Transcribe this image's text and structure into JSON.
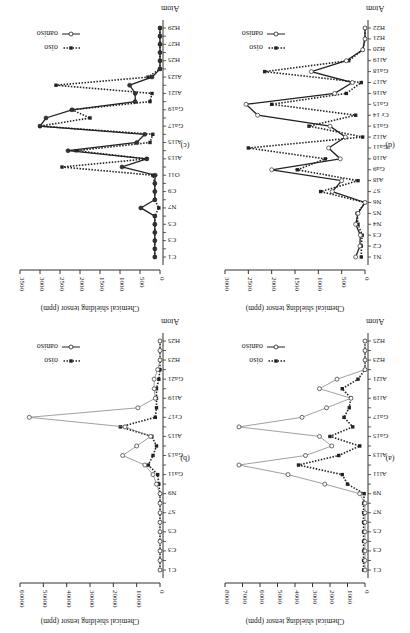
{
  "figure": {
    "orientation_note": "Figure displayed rotated 180 degrees",
    "panels": [
      "(a)",
      "(b)",
      "(c)",
      "(d)"
    ]
  },
  "chart_data": [
    {
      "id": "a",
      "type": "line",
      "panel_label": "(a)",
      "title": "",
      "xlabel": "Atom",
      "ylabel": "Chemical shielding tensor (ppm)",
      "ylim": [
        0,
        8000
      ],
      "yticks": [
        0,
        1000,
        2000,
        3000,
        4000,
        5000,
        6000,
        7000,
        8000
      ],
      "xtick_labels": [
        "C1",
        "C3",
        "C5",
        "N7",
        "N9",
        "Al11",
        "Al13",
        "Ga15",
        "Ga17",
        "Al19",
        "Al21",
        "H23",
        "H25"
      ],
      "x": [
        1,
        2,
        3,
        4,
        5,
        6,
        7,
        8,
        9,
        10,
        11,
        12,
        13,
        14,
        15,
        16,
        17,
        18,
        19,
        20,
        21,
        22,
        23,
        24,
        25
      ],
      "legend": [
        "σiso",
        "σaniso"
      ],
      "legend_position": "upper right",
      "grid": false,
      "series": [
        {
          "name": "σiso",
          "style": "dotted-filled-square",
          "values": [
            80,
            80,
            80,
            80,
            80,
            80,
            80,
            80,
            50,
            1000,
            1300,
            3800,
            1500,
            300,
            2000,
            700,
            1200,
            900,
            800,
            1300,
            400,
            0,
            0,
            0,
            0
          ]
        },
        {
          "name": "σaniso",
          "style": "solid-thin-open-circle",
          "values": [
            0,
            0,
            0,
            0,
            0,
            0,
            0,
            0,
            300,
            2300,
            4400,
            7200,
            3400,
            1900,
            2600,
            7200,
            3600,
            2200,
            800,
            2600,
            1600,
            0,
            0,
            0,
            0
          ]
        }
      ]
    },
    {
      "id": "b",
      "type": "line",
      "panel_label": "(b)",
      "title": "",
      "xlabel": "Atom",
      "ylabel": "Chemical shielding tensor (ppm)",
      "ylim": [
        0,
        60000
      ],
      "yticks": [
        0,
        10000,
        20000,
        30000,
        40000,
        50000,
        60000
      ],
      "xtick_labels": [
        "C1",
        "C3",
        "C5",
        "S7",
        "N9",
        "Ga11",
        "Ga13",
        "Al15",
        "Cr17",
        "Al19",
        "Ga21",
        "H23",
        "H25"
      ],
      "x": [
        1,
        2,
        3,
        4,
        5,
        6,
        7,
        8,
        9,
        10,
        11,
        12,
        13,
        14,
        15,
        16,
        17,
        18,
        19,
        20,
        21,
        22,
        23,
        24,
        25
      ],
      "legend": [
        "σiso",
        "σaniso"
      ],
      "legend_text_visible": [
        "σi",
        "so"
      ],
      "legend_position": "upper right",
      "grid": false,
      "series": [
        {
          "name": "σiso",
          "style": "dotted-filled-square",
          "values": [
            0,
            0,
            0,
            0,
            0,
            0,
            0,
            0,
            0,
            500,
            1000,
            5000,
            3000,
            1500,
            3500,
            17000,
            2000,
            1500,
            1500,
            1500,
            500,
            0,
            0,
            0,
            0
          ]
        },
        {
          "name": "σaniso",
          "style": "solid-thin-open-circle",
          "values": [
            0,
            0,
            0,
            0,
            0,
            0,
            0,
            0,
            0,
            1500,
            3000,
            6500,
            16000,
            10000,
            4000,
            15000,
            56000,
            9500,
            2000,
            2500,
            2500,
            1000,
            0,
            0,
            0
          ]
        }
      ]
    },
    {
      "id": "c",
      "type": "line",
      "panel_label": "(c)",
      "title": "",
      "xlabel": "Atom",
      "ylabel": "Chemical shielding tensor (ppm)",
      "ylim": [
        0,
        3500
      ],
      "yticks": [
        0,
        500,
        1000,
        1500,
        2000,
        2500,
        3000,
        3500
      ],
      "xtick_labels": [
        "C1",
        "C3",
        "C5",
        "N7",
        "C9",
        "O11",
        "Al13",
        "Al15",
        "Ga17",
        "Ga19",
        "Al21",
        "Al23",
        "H25",
        "H27",
        "H29"
      ],
      "x": [
        1,
        2,
        3,
        4,
        5,
        6,
        7,
        8,
        9,
        10,
        11,
        12,
        13,
        14,
        15,
        16,
        17,
        18,
        19,
        20,
        21,
        22,
        23,
        24,
        25,
        26,
        27,
        28,
        29
      ],
      "legend": [
        "σiso",
        "σaniso"
      ],
      "legend_position": "upper right",
      "grid": false,
      "series": [
        {
          "name": "σiso",
          "style": "dotted-filled-square",
          "values": [
            130,
            130,
            130,
            130,
            130,
            130,
            30,
            130,
            130,
            130,
            180,
            2450,
            330,
            2100,
            250,
            180,
            3000,
            1750,
            2200,
            250,
            200,
            2600,
            300,
            0,
            0,
            0,
            0,
            0,
            0
          ]
        },
        {
          "name": "σaniso",
          "style": "solid-filled-circle",
          "values": [
            130,
            130,
            130,
            130,
            130,
            130,
            480,
            130,
            130,
            130,
            120,
            950,
            330,
            2300,
            580,
            380,
            3000,
            2850,
            2200,
            620,
            620,
            760,
            200,
            0,
            0,
            0,
            0,
            0,
            0
          ]
        }
      ]
    },
    {
      "id": "d",
      "type": "line",
      "panel_label": "(d)",
      "title": "",
      "xlabel": "Atom",
      "ylabel": "Chemical shielding tensor (ppm)",
      "ylim": [
        0,
        3000
      ],
      "yticks": [
        0,
        500,
        1000,
        1500,
        2000,
        2500,
        3000
      ],
      "xtick_labels": [
        "N1",
        "C2",
        "C3",
        "N4",
        "N5",
        "N6",
        "S7",
        "Al8",
        "Ga9",
        "Al10",
        "Ga11",
        "Al12",
        "Ga13",
        "Cr 14",
        "Ga15",
        "Al16",
        "Al17",
        "Ga18",
        "Al19",
        "H20",
        "H21",
        "H22"
      ],
      "x": [
        1,
        2,
        3,
        4,
        5,
        6,
        7,
        8,
        9,
        10,
        11,
        12,
        13,
        14,
        15,
        16,
        17,
        18,
        19,
        20,
        21,
        22
      ],
      "legend": [
        "σiso",
        "σaniso"
      ],
      "legend_position": "upper right",
      "grid": false,
      "series": [
        {
          "name": "σiso",
          "style": "dotted-filled-square",
          "values": [
            80,
            80,
            60,
            150,
            170,
            0,
            950,
            150,
            1450,
            850,
            2500,
            50,
            1200,
            200,
            2000,
            400,
            80,
            2150,
            350,
            50,
            0,
            0
          ]
        },
        {
          "name": "σaniso",
          "style": "solid-open-circle",
          "values": [
            200,
            110,
            100,
            200,
            150,
            0,
            700,
            500,
            2000,
            530,
            780,
            420,
            750,
            2300,
            2550,
            650,
            270,
            1150,
            400,
            50,
            0,
            0
          ]
        }
      ]
    }
  ],
  "labels": {
    "atom": "Atom",
    "ylabel": "Chemical shielding tensor (ppm)",
    "legend_iso": "σiso",
    "legend_aniso": "σaniso",
    "legend_b_line1": "σi",
    "legend_b_line2": "so"
  }
}
